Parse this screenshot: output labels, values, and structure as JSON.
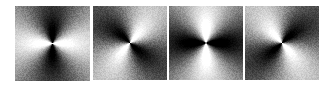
{
  "figure": {
    "title": "",
    "background_color": "#ffffff",
    "width": 336,
    "height": 86,
    "panel_count": 4,
    "colormap": "grayscale"
  },
  "chart_data": {
    "type": "heatmap",
    "title": "",
    "subtitle": "",
    "xlabel": "",
    "ylabel": "",
    "grid": false,
    "legend": "none",
    "colormap": "gray",
    "value_range": [
      0,
      1
    ],
    "field_model": "I(r, theta) = clamp(0.5 + gain * cos(2*(theta - phi)) * falloff(r) + noise)",
    "panels": [
      {
        "index": 0,
        "label": "",
        "left": 15,
        "top": 6,
        "size": 75,
        "center_x": 52,
        "center_y": 45,
        "dark_lobe_angle_deg": 90,
        "dark_lobe_axis": "vertical",
        "bright_lobe_angle_deg": 0,
        "symmetry_order": 2,
        "gain": 1.15,
        "phase_deg": 90,
        "radial_falloff": 0.42,
        "center_brightness": 0.5,
        "corner_brightness": 0.55,
        "noise_amplitude": 0.055,
        "swirl_deg_per_unit": 0
      },
      {
        "index": 1,
        "label": "",
        "left": 93,
        "top": 6,
        "size": 74,
        "center_x": 130,
        "center_y": 45,
        "dark_lobe_angle_deg": 135,
        "dark_lobe_axis": "diagonal-nw-se",
        "bright_lobe_angle_deg": 45,
        "symmetry_order": 2,
        "gain": 1.1,
        "phase_deg": 135,
        "radial_falloff": 0.4,
        "center_brightness": 0.5,
        "corner_brightness": 0.52,
        "noise_amplitude": 0.06,
        "swirl_deg_per_unit": 14
      },
      {
        "index": 2,
        "label": "",
        "left": 169,
        "top": 6,
        "size": 74,
        "center_x": 206,
        "center_y": 45,
        "dark_lobe_angle_deg": 0,
        "dark_lobe_axis": "horizontal",
        "bright_lobe_angle_deg": 90,
        "symmetry_order": 2,
        "gain": 1.25,
        "phase_deg": 0,
        "radial_falloff": 0.46,
        "center_brightness": 0.5,
        "corner_brightness": 0.5,
        "noise_amplitude": 0.05,
        "swirl_deg_per_unit": 0
      },
      {
        "index": 3,
        "label": "",
        "left": 245,
        "top": 6,
        "size": 74,
        "center_x": 282,
        "center_y": 45,
        "dark_lobe_angle_deg": 45,
        "dark_lobe_axis": "diagonal-sw-ne",
        "bright_lobe_angle_deg": 135,
        "symmetry_order": 2,
        "gain": 1.12,
        "phase_deg": 45,
        "radial_falloff": 0.4,
        "center_brightness": 0.5,
        "corner_brightness": 0.52,
        "noise_amplitude": 0.06,
        "swirl_deg_per_unit": -14
      }
    ]
  }
}
